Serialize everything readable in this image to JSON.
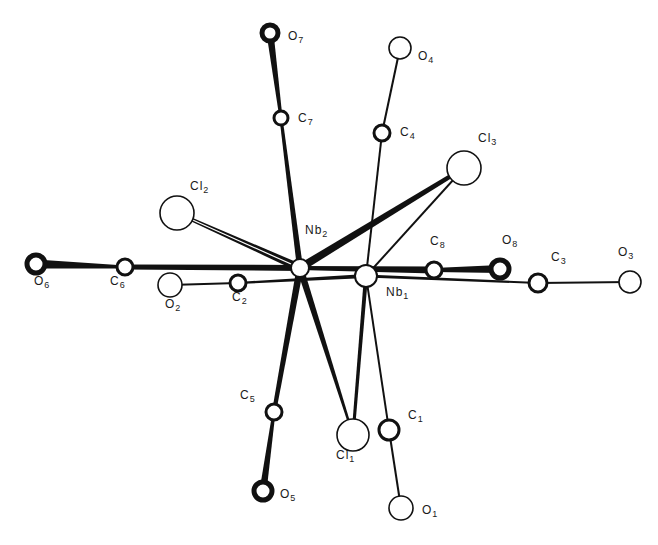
{
  "diagram": {
    "type": "molecular-structure",
    "colors": {
      "ink": "#111111",
      "background": "#ffffff"
    },
    "atoms": [
      {
        "id": "Nb2",
        "el": "Nb",
        "sub": "2",
        "x": 300,
        "y": 268,
        "r": 9,
        "style": "open",
        "lx": 305,
        "ly": 230
      },
      {
        "id": "Nb1",
        "el": "Nb",
        "sub": "1",
        "x": 366,
        "y": 276,
        "r": 11,
        "style": "open",
        "lx": 386,
        "ly": 292
      },
      {
        "id": "O7",
        "el": "O",
        "sub": "7",
        "x": 270,
        "y": 33,
        "r": 8,
        "style": "heavy",
        "lx": 288,
        "ly": 36
      },
      {
        "id": "C7",
        "el": "C",
        "sub": "7",
        "x": 281,
        "y": 118,
        "r": 7,
        "style": "medium",
        "lx": 298,
        "ly": 118
      },
      {
        "id": "O4",
        "el": "O",
        "sub": "4",
        "x": 400,
        "y": 48,
        "r": 11,
        "style": "light",
        "lx": 418,
        "ly": 56
      },
      {
        "id": "C4",
        "el": "C",
        "sub": "4",
        "x": 382,
        "y": 133,
        "r": 8,
        "style": "medium",
        "lx": 400,
        "ly": 132
      },
      {
        "id": "Cl3",
        "el": "Cl",
        "sub": "3",
        "x": 464,
        "y": 168,
        "r": 17,
        "style": "light",
        "lx": 478,
        "ly": 138
      },
      {
        "id": "Cl2",
        "el": "Cl",
        "sub": "2",
        "x": 177,
        "y": 213,
        "r": 17,
        "style": "light",
        "lx": 190,
        "ly": 186
      },
      {
        "id": "O6",
        "el": "O",
        "sub": "6",
        "x": 36,
        "y": 264,
        "r": 9,
        "style": "heavy",
        "lx": 34,
        "ly": 281
      },
      {
        "id": "C6",
        "el": "C",
        "sub": "6",
        "x": 125,
        "y": 267,
        "r": 8,
        "style": "medium",
        "lx": 110,
        "ly": 281
      },
      {
        "id": "O2",
        "el": "O",
        "sub": "2",
        "x": 170,
        "y": 285,
        "r": 12,
        "style": "light",
        "lx": 165,
        "ly": 304
      },
      {
        "id": "C2",
        "el": "C",
        "sub": "2",
        "x": 238,
        "y": 283,
        "r": 8,
        "style": "medium",
        "lx": 232,
        "ly": 297
      },
      {
        "id": "C8",
        "el": "C",
        "sub": "8",
        "x": 434,
        "y": 270,
        "r": 8,
        "style": "medium",
        "lx": 430,
        "ly": 241
      },
      {
        "id": "O8",
        "el": "O",
        "sub": "8",
        "x": 500,
        "y": 269,
        "r": 9,
        "style": "heavy",
        "lx": 502,
        "ly": 240
      },
      {
        "id": "C3",
        "el": "C",
        "sub": "3",
        "x": 538,
        "y": 283,
        "r": 9,
        "style": "medium",
        "lx": 551,
        "ly": 257
      },
      {
        "id": "O3",
        "el": "O",
        "sub": "3",
        "x": 630,
        "y": 282,
        "r": 11,
        "style": "light",
        "lx": 618,
        "ly": 252
      },
      {
        "id": "C5",
        "el": "C",
        "sub": "5",
        "x": 274,
        "y": 412,
        "r": 8,
        "style": "medium",
        "lx": 240,
        "ly": 395
      },
      {
        "id": "O5",
        "el": "O",
        "sub": "5",
        "x": 263,
        "y": 491,
        "r": 9,
        "style": "heavy",
        "lx": 280,
        "ly": 494
      },
      {
        "id": "Cl1",
        "el": "Cl",
        "sub": "1",
        "x": 353,
        "y": 435,
        "r": 16,
        "style": "light",
        "lx": 336,
        "ly": 455
      },
      {
        "id": "C1",
        "el": "C",
        "sub": "1",
        "x": 389,
        "y": 430,
        "r": 10,
        "style": "medium",
        "lx": 408,
        "ly": 415
      },
      {
        "id": "O1",
        "el": "O",
        "sub": "1",
        "x": 401,
        "y": 508,
        "r": 12,
        "style": "light",
        "lx": 422,
        "ly": 510
      }
    ],
    "bonds": [
      {
        "a": "Nb2",
        "b": "C7",
        "w1": 6,
        "w2": 3
      },
      {
        "a": "C7",
        "b": "O7",
        "w1": 3,
        "w2": 7
      },
      {
        "a": "Nb1",
        "b": "C4",
        "w1": 2,
        "w2": 2
      },
      {
        "a": "C4",
        "b": "O4",
        "w1": 2,
        "w2": 2
      },
      {
        "a": "Nb2",
        "b": "Cl3",
        "w1": 8,
        "w2": 4
      },
      {
        "a": "Nb1",
        "b": "Cl3",
        "w1": 2,
        "w2": 2
      },
      {
        "a": "Nb2",
        "b": "Cl2",
        "w1": 8,
        "w2": 3,
        "hollow": true
      },
      {
        "a": "Nb2",
        "b": "C6",
        "w1": 6,
        "w2": 5
      },
      {
        "a": "C6",
        "b": "O6",
        "w1": 3,
        "w2": 9
      },
      {
        "a": "Nb1",
        "b": "C2",
        "w1": 4,
        "w2": 2
      },
      {
        "a": "C2",
        "b": "O2",
        "w1": 2,
        "w2": 2
      },
      {
        "a": "Nb2",
        "b": "C8",
        "w1": 4,
        "w2": 7
      },
      {
        "a": "C8",
        "b": "O8",
        "w1": 4,
        "w2": 8
      },
      {
        "a": "Nb1",
        "b": "C3",
        "w1": 3,
        "w2": 2
      },
      {
        "a": "C3",
        "b": "O3",
        "w1": 2,
        "w2": 2
      },
      {
        "a": "Nb2",
        "b": "C5",
        "w1": 7,
        "w2": 4
      },
      {
        "a": "C5",
        "b": "O5",
        "w1": 3,
        "w2": 7
      },
      {
        "a": "Nb2",
        "b": "Cl1",
        "w1": 7,
        "w2": 2
      },
      {
        "a": "Nb1",
        "b": "Cl1",
        "w1": 4,
        "w2": 3
      },
      {
        "a": "Nb1",
        "b": "C1",
        "w1": 2,
        "w2": 2
      },
      {
        "a": "C1",
        "b": "O1",
        "w1": 2,
        "w2": 2
      }
    ]
  }
}
